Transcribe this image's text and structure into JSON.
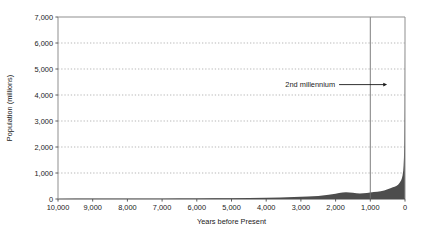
{
  "chart_data": {
    "type": "area",
    "title": "",
    "xlabel": "Years before Present",
    "ylabel": "Population (millions)",
    "xlim": [
      10000,
      0
    ],
    "ylim": [
      0,
      7000
    ],
    "x_reversed": true,
    "grid": "horizontal-dotted",
    "legend": "none",
    "series_name": "World population",
    "series_color": "#4d4d4d",
    "x_tick_labels": [
      "10,000",
      "9,000",
      "8,000",
      "7,000",
      "6,000",
      "5,000",
      "4,000",
      "3,000",
      "2,000",
      "1,000",
      "0"
    ],
    "x_tick_values": [
      10000,
      9000,
      8000,
      7000,
      6000,
      5000,
      4000,
      3000,
      2000,
      1000,
      0
    ],
    "y_tick_labels": [
      "0",
      "1,000",
      "2,000",
      "3,000",
      "4,000",
      "5,000",
      "6,000",
      "7,000"
    ],
    "y_tick_values": [
      0,
      1000,
      2000,
      3000,
      4000,
      5000,
      6000,
      7000
    ],
    "x": [
      10000,
      9500,
      9000,
      8500,
      8000,
      7500,
      7000,
      6500,
      6000,
      5500,
      5000,
      4500,
      4000,
      3600,
      3200,
      2800,
      2500,
      2200,
      2000,
      1900,
      1800,
      1700,
      1600,
      1500,
      1400,
      1300,
      1200,
      1100,
      1000,
      900,
      800,
      700,
      600,
      500,
      420,
      350,
      300,
      250,
      200,
      170,
      140,
      110,
      90,
      70,
      50,
      40,
      30,
      20,
      10,
      0
    ],
    "y": [
      4,
      5,
      6,
      7,
      9,
      11,
      14,
      17,
      21,
      26,
      32,
      40,
      50,
      62,
      76,
      95,
      120,
      160,
      200,
      230,
      250,
      255,
      250,
      240,
      225,
      215,
      220,
      235,
      250,
      265,
      280,
      300,
      330,
      375,
      410,
      450,
      470,
      500,
      545,
      600,
      650,
      720,
      800,
      900,
      1100,
      1300,
      1600,
      2200,
      3400,
      6000
    ],
    "annotations": [
      {
        "type": "text-with-arrow",
        "label": "2nd millennium",
        "y_value": 4400,
        "arrow_from_x": 1900,
        "arrow_to_x": 580,
        "arrow_direction": "right"
      },
      {
        "type": "vertical-line",
        "x_value": 1000,
        "color": "#707070"
      }
    ]
  }
}
